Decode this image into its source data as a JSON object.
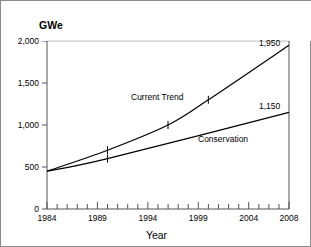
{
  "chart_data": {
    "type": "line",
    "title": "",
    "subtitle": "",
    "xlabel": "Year",
    "ylabel": "GWe",
    "ylabel_position": "top-left",
    "xlim": [
      1984,
      2008
    ],
    "ylim": [
      0,
      2000
    ],
    "grid": false,
    "legend": "inline-labels",
    "x_major_ticks": [
      1984,
      1989,
      1994,
      1999,
      2004,
      2008
    ],
    "x_minor_tick_step": 1,
    "y_major_ticks": [
      0,
      500,
      1000,
      1500,
      2000
    ],
    "x_tick_labels": [
      "1984",
      "1989",
      "1994",
      "1999",
      "2004",
      "2008"
    ],
    "y_tick_labels": [
      "0",
      "500",
      "1,000",
      "1,500",
      "2,000"
    ],
    "series": [
      {
        "name": "Current Trend",
        "label": "Current Trend",
        "endpoint_label": "1,950",
        "color": "#000000",
        "x": [
          1984,
          1990,
          1996,
          2000,
          2008
        ],
        "values": [
          450,
          700,
          1000,
          1300,
          1950
        ],
        "markers_at_x": [
          1990,
          1996,
          2000
        ]
      },
      {
        "name": "Conservation",
        "label": "Conservation",
        "endpoint_label": "1,150",
        "color": "#000000",
        "x": [
          1984,
          1990,
          2008
        ],
        "values": [
          450,
          600,
          1150
        ],
        "markers_at_x": [
          1990
        ]
      }
    ]
  },
  "labels": {
    "y_unit": "GWe",
    "x_title": "Year",
    "current_trend": "Current Trend",
    "conservation": "Conservation",
    "current_trend_end": "1,950",
    "conservation_end": "1,150",
    "y0": "0",
    "y500": "500",
    "y1000": "1,000",
    "y1500": "1,500",
    "y2000": "2,000",
    "x1984": "1984",
    "x1989": "1989",
    "x1994": "1994",
    "x1999": "1999",
    "x2004": "2004",
    "x2008": "2008"
  },
  "colors": {
    "background": "#ffffff",
    "axis": "#555555",
    "line": "#000000",
    "border": "#8a8a8a",
    "text": "#000000"
  }
}
